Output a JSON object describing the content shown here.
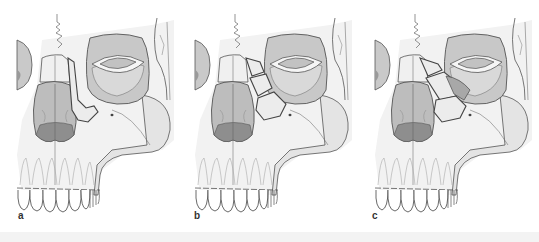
{
  "figure": {
    "panels": [
      {
        "label": "a",
        "fracture": "single central fragment"
      },
      {
        "label": "b",
        "fracture": "comminuted, fragments outside canthal insertion"
      },
      {
        "label": "c",
        "fracture": "comminuted, fragments extending into canthal insertion"
      }
    ]
  },
  "colors": {
    "outline": "#555555",
    "bone_light": "#eeeeee",
    "bone_mid": "#d6d6d6",
    "sinus_fill": "#b5b5b5",
    "sinus_dark": "#8f8f8f",
    "orbit_fill": "#c4c4c4",
    "background": "#ffffff"
  }
}
